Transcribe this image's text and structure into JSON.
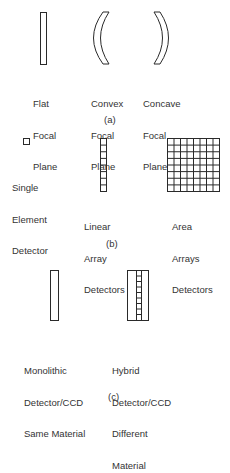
{
  "section_a": {
    "caption": "(a)",
    "items": [
      {
        "shape": "flat-plane",
        "label_lines": [
          "Flat",
          "Focal",
          "Plane"
        ]
      },
      {
        "shape": "convex-curve",
        "label_lines": [
          "Convex",
          "Focal",
          "Plane"
        ]
      },
      {
        "shape": "concave-curve",
        "label_lines": [
          "Concave",
          "Focal",
          "Plane"
        ]
      }
    ]
  },
  "section_b": {
    "caption": "(b)",
    "items": [
      {
        "shape": "single-square",
        "label_lines": [
          "Single",
          "Element",
          "Detector"
        ]
      },
      {
        "shape": "linear-array-8-cells",
        "label_lines": [
          "Linear",
          "Array",
          "Detectors"
        ]
      },
      {
        "shape": "area-array-8x8-grid",
        "label_lines": [
          "Area",
          "Arrays",
          "Detectors"
        ]
      }
    ]
  },
  "section_c": {
    "caption": "(c)",
    "items": [
      {
        "shape": "monolithic-bar",
        "label_lines": [
          "Monolithic",
          "Detector/CCD",
          "Same Material"
        ]
      },
      {
        "shape": "hybrid-bar-with-strip",
        "label_lines": [
          "Hybrid",
          "Detector/CCD",
          "Different",
          "Material"
        ]
      }
    ]
  },
  "colors": {
    "line": "#2a2a2a",
    "text": "#333333",
    "background": "#ffffff"
  }
}
